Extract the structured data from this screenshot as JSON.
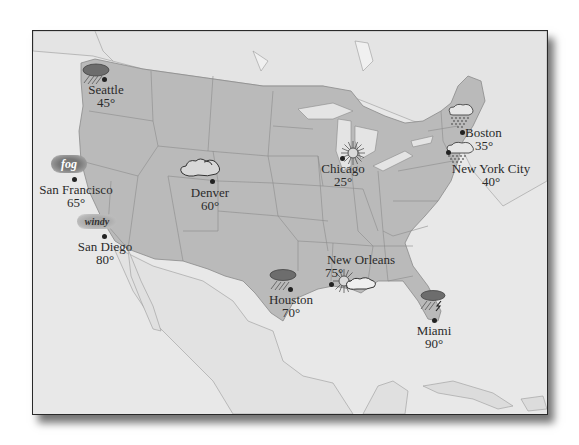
{
  "map": {
    "title": "",
    "colors": {
      "us_land": "#b9b9b9",
      "other_land": "#e6e6e6",
      "water": "#e9e9e9",
      "border_lines": "#8f8f8f",
      "frame": "#2a2a2a",
      "text": "#2b2b2b"
    }
  },
  "cities": [
    {
      "name": "Seattle",
      "temp": "45°",
      "condition": "rain",
      "icon": "rain-cloud-icon"
    },
    {
      "name": "San Francisco",
      "temp": "65°",
      "condition": "fog",
      "icon": "fog-icon",
      "tag": "fog"
    },
    {
      "name": "San Diego",
      "temp": "80°",
      "condition": "windy",
      "icon": "wind-icon",
      "tag": "windy"
    },
    {
      "name": "Denver",
      "temp": "60°",
      "condition": "cloudy",
      "icon": "cloud-icon"
    },
    {
      "name": "Chicago",
      "temp": "25°",
      "condition": "sunny",
      "icon": "sun-icon"
    },
    {
      "name": "Boston",
      "temp": "35°",
      "condition": "snow",
      "icon": "snow-cloud-icon"
    },
    {
      "name": "New York City",
      "temp": "40°",
      "condition": "snow",
      "icon": "snow-cloud-icon"
    },
    {
      "name": "New Orleans",
      "temp": "75°",
      "condition": "partly cloudy",
      "icon": "sun-cloud-icon"
    },
    {
      "name": "Houston",
      "temp": "70°",
      "condition": "rain",
      "icon": "rain-cloud-icon"
    },
    {
      "name": "Miami",
      "temp": "90°",
      "condition": "thunderstorm",
      "icon": "thunderstorm-icon"
    }
  ]
}
